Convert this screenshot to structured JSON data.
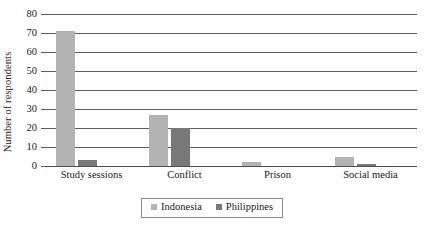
{
  "chart_data": {
    "type": "bar",
    "title": "",
    "xlabel": "",
    "ylabel": "Number of respondents",
    "ylim": [
      0,
      80
    ],
    "ytick_step": 10,
    "yticks": [
      "80",
      "70",
      "60",
      "50",
      "40",
      "30",
      "20",
      "10",
      "0"
    ],
    "grid": true,
    "legend_position": "bottom-center",
    "categories": [
      "Study sessions",
      "Conflict",
      "Prison",
      "Social media"
    ],
    "series": [
      {
        "name": "Indonesia",
        "color": "#b3b3b3",
        "values": [
          71,
          27,
          2,
          5
        ]
      },
      {
        "name": "Philippines",
        "color": "#787878",
        "values": [
          3,
          20,
          0,
          1
        ]
      }
    ]
  },
  "legend": {
    "items": [
      {
        "label": "Indonesia",
        "marker": "square-swatch-light"
      },
      {
        "label": "Philippines",
        "marker": "square-swatch-dark"
      }
    ]
  },
  "colors": {
    "indonesia": "#b3b3b3",
    "philippines": "#787878",
    "gridline": "#5e5e5e",
    "text": "#1a1a1a",
    "background": "#ffffff"
  }
}
